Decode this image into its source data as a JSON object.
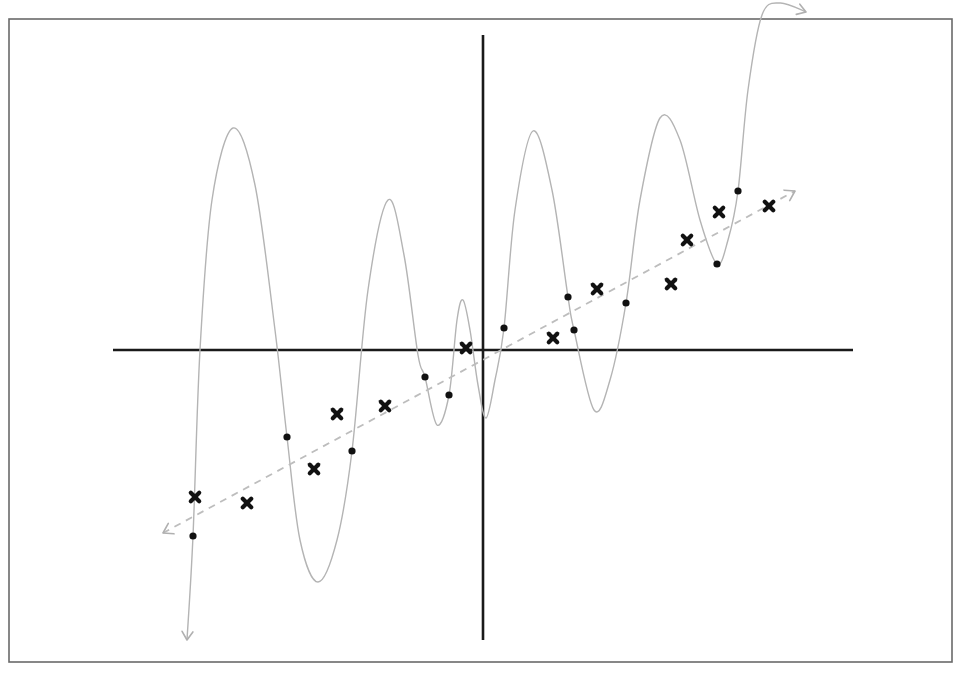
{
  "chart_data": {
    "type": "scatter",
    "title": "",
    "xlabel": "",
    "ylabel": "",
    "grid": false,
    "legend": null,
    "frame": {
      "x": 9,
      "y": 19,
      "width": 943,
      "height": 643
    },
    "axes": {
      "origin_px": [
        483,
        350
      ],
      "x_axis": {
        "x1": 113,
        "x2": 853,
        "y": 350
      },
      "y_axis": {
        "x": 483,
        "y1": 35,
        "y2": 640
      }
    },
    "series": [
      {
        "name": "training points",
        "marker": "dot",
        "color": "#111111",
        "points_px": [
          [
            193,
            536
          ],
          [
            287,
            437
          ],
          [
            352,
            451
          ],
          [
            425,
            377
          ],
          [
            449,
            395
          ],
          [
            504,
            328
          ],
          [
            568,
            297
          ],
          [
            574,
            330
          ],
          [
            626,
            303
          ],
          [
            717,
            264
          ],
          [
            738,
            191
          ]
        ]
      },
      {
        "name": "test points",
        "marker": "cross",
        "color": "#111111",
        "points_px": [
          [
            195,
            497
          ],
          [
            247,
            503
          ],
          [
            314,
            469
          ],
          [
            337,
            414
          ],
          [
            385,
            406
          ],
          [
            466,
            348
          ],
          [
            553,
            338
          ],
          [
            597,
            289
          ],
          [
            671,
            284
          ],
          [
            687,
            240
          ],
          [
            719,
            212
          ],
          [
            769,
            206
          ]
        ]
      },
      {
        "name": "overfit polynomial",
        "marker": "line",
        "style": "solid",
        "color": "#b4b4b4",
        "path_px": [
          [
            187,
            640
          ],
          [
            193,
            536
          ],
          [
            200,
            350
          ],
          [
            212,
            200
          ],
          [
            233,
            128
          ],
          [
            255,
            185
          ],
          [
            275,
            330
          ],
          [
            287,
            437
          ],
          [
            300,
            540
          ],
          [
            318,
            582
          ],
          [
            337,
            540
          ],
          [
            352,
            451
          ],
          [
            368,
            290
          ],
          [
            388,
            200
          ],
          [
            404,
            255
          ],
          [
            418,
            355
          ],
          [
            425,
            377
          ],
          [
            437,
            425
          ],
          [
            449,
            395
          ],
          [
            457,
            320
          ],
          [
            463,
            300
          ],
          [
            470,
            330
          ],
          [
            478,
            385
          ],
          [
            486,
            418
          ],
          [
            495,
            380
          ],
          [
            504,
            328
          ],
          [
            515,
            210
          ],
          [
            533,
            131
          ],
          [
            552,
            190
          ],
          [
            568,
            297
          ],
          [
            574,
            330
          ],
          [
            594,
            410
          ],
          [
            610,
            380
          ],
          [
            626,
            303
          ],
          [
            640,
            200
          ],
          [
            660,
            118
          ],
          [
            680,
            140
          ],
          [
            700,
            220
          ],
          [
            717,
            264
          ],
          [
            728,
            240
          ],
          [
            738,
            191
          ],
          [
            748,
            90
          ],
          [
            762,
            15
          ],
          [
            780,
            3
          ],
          [
            806,
            12
          ]
        ],
        "end_arrows": [
          "down at (187, 640)",
          "right at (806, 12)"
        ]
      },
      {
        "name": "linear fit",
        "marker": "line",
        "style": "dashed",
        "color": "#bdbdbd",
        "start_px": [
          163,
          533
        ],
        "end_px": [
          795,
          191
        ],
        "end_arrows": [
          "both"
        ]
      }
    ]
  }
}
